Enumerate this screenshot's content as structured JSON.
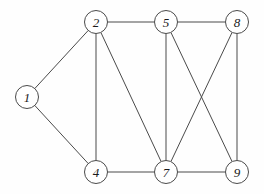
{
  "diagram": {
    "type": "node-link-graph",
    "canvas": {
      "width": 264,
      "height": 194
    },
    "style": {
      "background_color": "#fefefe",
      "edge_color": "#4a4a4a",
      "node_fill_color": "#ffffff",
      "node_stroke_color": "#4a4a4a",
      "label_color": "#1a1a1a",
      "node_radius": 11.5,
      "stroke_width": 1
    },
    "nodes": [
      {
        "id": "1",
        "label": "1",
        "x": 27,
        "y": 97
      },
      {
        "id": "2",
        "label": "2",
        "x": 96,
        "y": 22
      },
      {
        "id": "4",
        "label": "4",
        "x": 96,
        "y": 172
      },
      {
        "id": "5",
        "label": "5",
        "x": 166,
        "y": 22
      },
      {
        "id": "7",
        "label": "7",
        "x": 166,
        "y": 172
      },
      {
        "id": "8",
        "label": "8",
        "x": 237,
        "y": 22
      },
      {
        "id": "9",
        "label": "9",
        "x": 237,
        "y": 172
      }
    ],
    "edges": [
      {
        "source": "1",
        "target": "2"
      },
      {
        "source": "1",
        "target": "4"
      },
      {
        "source": "2",
        "target": "4"
      },
      {
        "source": "2",
        "target": "5"
      },
      {
        "source": "2",
        "target": "7"
      },
      {
        "source": "4",
        "target": "7"
      },
      {
        "source": "5",
        "target": "7"
      },
      {
        "source": "5",
        "target": "8"
      },
      {
        "source": "5",
        "target": "9"
      },
      {
        "source": "7",
        "target": "8"
      },
      {
        "source": "7",
        "target": "9"
      },
      {
        "source": "8",
        "target": "9"
      }
    ]
  }
}
